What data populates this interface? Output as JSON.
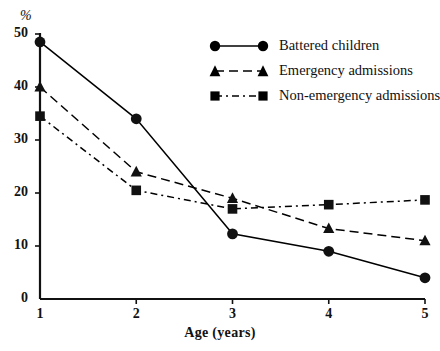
{
  "chart_data": {
    "type": "line",
    "title": "",
    "xlabel": "Age (years)",
    "ylabel": "%",
    "x": [
      1,
      2,
      3,
      4,
      5
    ],
    "xtick_labels": [
      "1",
      "2",
      "3",
      "4",
      "5"
    ],
    "ytick_labels": [
      "0",
      "10",
      "20",
      "30",
      "40",
      "50"
    ],
    "yticks": [
      0,
      10,
      20,
      30,
      40,
      50
    ],
    "xlim": [
      1,
      5
    ],
    "ylim": [
      0,
      50
    ],
    "grid": false,
    "legend_position": "top-right",
    "series": [
      {
        "name": "Battered children",
        "marker": "circle",
        "linestyle": "solid",
        "color": "#000000",
        "values": [
          48.5,
          34.0,
          12.3,
          9.0,
          4.0
        ]
      },
      {
        "name": "Emergency admissions",
        "marker": "triangle",
        "linestyle": "dashed",
        "color": "#000000",
        "values": [
          40.0,
          24.0,
          19.0,
          13.3,
          11.0
        ]
      },
      {
        "name": "Non-emergency admissions",
        "marker": "square",
        "linestyle": "dashdot",
        "color": "#000000",
        "values": [
          34.5,
          20.5,
          17.0,
          17.8,
          18.7
        ]
      }
    ]
  }
}
